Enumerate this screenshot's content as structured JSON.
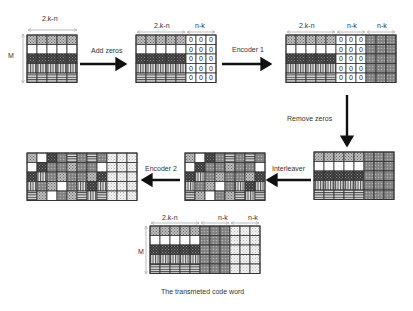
{
  "labels": {
    "width_2kn": "2.k-n",
    "width_nk": "n-k",
    "rows": "M",
    "zero": "0"
  },
  "steps": {
    "add_zeros": "Add zeros",
    "encoder1": "Encoder 1",
    "remove_zeros": "Remove zeros",
    "interleaver": "Interleaver",
    "encoder2": "Encoder 2"
  },
  "caption": "The transmeted code word",
  "grid": {
    "rows": 5,
    "data_cols": 5,
    "parity_cols": 3,
    "row_patterns": [
      "crosshatch",
      "white",
      "dark",
      "vertical",
      "horizontal"
    ],
    "parity1_pattern": "gray-check",
    "parity2_pattern": "light-dots",
    "interleaved": [
      [
        "crosshatch",
        "white",
        "dark",
        "gray-check",
        "horizontal",
        "gray-check",
        "horizontal",
        "gray-check"
      ],
      [
        "white",
        "dark",
        "gray-check",
        "gray-check",
        "crosshatch",
        "gray-check",
        "gray-check",
        "white"
      ],
      [
        "dark",
        "vertical",
        "gray-check",
        "crosshatch",
        "gray-check",
        "gray-check",
        "crosshatch",
        "dark"
      ],
      [
        "vertical",
        "gray-check",
        "crosshatch",
        "white",
        "gray-check",
        "vertical",
        "dark",
        "vertical"
      ],
      [
        "horizontal",
        "crosshatch",
        "white",
        "gray-check",
        "crosshatch",
        "horizontal",
        "vertical",
        "horizontal"
      ]
    ]
  },
  "colors": {
    "border": "#333333",
    "arrow": "#111111"
  }
}
